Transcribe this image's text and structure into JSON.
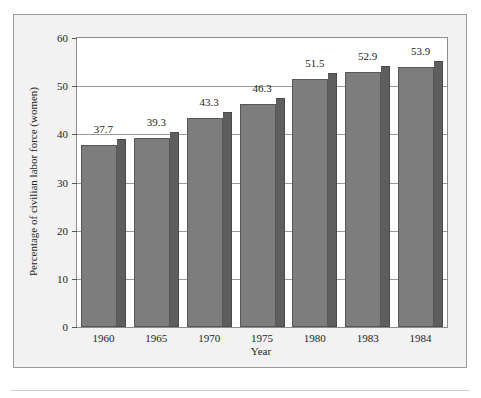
{
  "chart_data": {
    "type": "bar",
    "title": "",
    "subtitle": "",
    "xlabel": "Year",
    "ylabel": "Percentage of civilian labor force (women)",
    "categories": [
      "1960",
      "1965",
      "1970",
      "1975",
      "1980",
      "1983",
      "1984"
    ],
    "values": [
      37.7,
      39.3,
      43.3,
      46.3,
      51.5,
      52.9,
      53.9
    ],
    "value_labels": [
      "37.7",
      "39.3",
      "43.3",
      "46.3",
      "51.5",
      "52.9",
      "53.9"
    ],
    "ylim": [
      0,
      60
    ],
    "yticks": [
      0,
      10,
      20,
      30,
      40,
      50,
      60
    ],
    "ytick_labels": [
      "0",
      "10",
      "20",
      "30",
      "40",
      "50",
      "60"
    ],
    "grid": true,
    "grid_axis": "y",
    "legend": null,
    "legend_position": "none",
    "bar_style": "3d-shaded",
    "colors": {
      "bar_face": "#7d7d7d",
      "bar_side": "#5e5e5e",
      "bar_outline": "#575757",
      "plot_background": "#ffffff",
      "figure_background": "#f2f2f2",
      "gridline": "#9a9a9a",
      "axis": "#8d8d8d",
      "text": "#231f20"
    }
  }
}
